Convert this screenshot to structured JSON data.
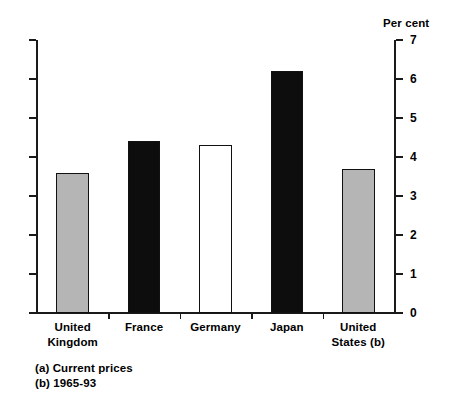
{
  "chart_data": {
    "type": "bar",
    "title": "",
    "subtitle": "",
    "xlabel": "",
    "ylabel": "Per cent",
    "axis_unit_label": "Per cent",
    "ylim": [
      0,
      7
    ],
    "ytick_labels": [
      "0",
      "1",
      "2",
      "3",
      "4",
      "5",
      "6",
      "7"
    ],
    "ytick_values": [
      0,
      1,
      2,
      3,
      4,
      5,
      6,
      7
    ],
    "grid": false,
    "legend": null,
    "axis_position": "right",
    "categories": [
      "United\nKingdom",
      "France",
      "Germany",
      "Japan",
      "United\nStates (b)"
    ],
    "values": [
      3.6,
      4.4,
      4.3,
      6.2,
      3.7
    ],
    "bar_styles": [
      "grey",
      "black",
      "white",
      "black",
      "grey"
    ],
    "annotations": [
      "(a) Current prices",
      "(b) 1965-93"
    ]
  },
  "footnotes": {
    "a": "(a) Current prices",
    "b": "(b) 1965-93"
  },
  "colors": {
    "grey_fill": "#b5b5b5",
    "black_fill": "#0d0d0d",
    "white_fill": "#ffffff",
    "outline": "#111111",
    "axis": "#1a1a1a"
  }
}
